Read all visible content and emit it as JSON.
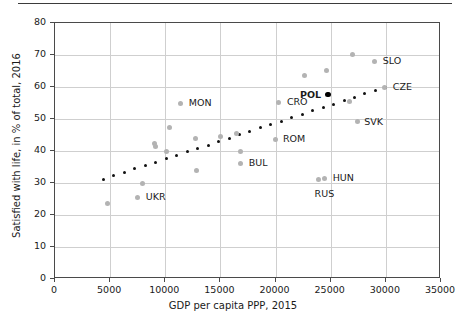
{
  "chart_data": {
    "type": "scatter",
    "title": "",
    "xlabel": "GDP per capita PPP, 2015",
    "ylabel": "Satisfied with life, in % of total, 2016",
    "xlim": [
      0,
      35000
    ],
    "ylim": [
      0,
      80
    ],
    "xticks": [
      0,
      5000,
      10000,
      15000,
      20000,
      25000,
      30000,
      35000
    ],
    "yticks": [
      0,
      10,
      20,
      30,
      40,
      50,
      60,
      70,
      80
    ],
    "xticklabels": [
      "0",
      "5000",
      "10000",
      "15000",
      "20000",
      "25000",
      "30000",
      "35000"
    ],
    "yticklabels": [
      "0",
      "10",
      "20",
      "30",
      "40",
      "50",
      "60",
      "70",
      "80"
    ],
    "grid": "both",
    "legend": "none",
    "marker_color": "#b3b3b3",
    "highlight_color": "#000000",
    "trendline_color": "#111111",
    "points": [
      {
        "x": 4800,
        "y": 23.5,
        "label": "",
        "highlight": false
      },
      {
        "x": 7500,
        "y": 25.5,
        "label": "UKR",
        "highlight": false,
        "label_dx": 9,
        "label_dy": -4
      },
      {
        "x": 7900,
        "y": 30.0,
        "label": "",
        "highlight": false
      },
      {
        "x": 9050,
        "y": 42.5,
        "label": "",
        "highlight": false
      },
      {
        "x": 9100,
        "y": 41.3,
        "label": "",
        "highlight": false
      },
      {
        "x": 10150,
        "y": 39.8,
        "label": "",
        "highlight": false
      },
      {
        "x": 10400,
        "y": 47.2,
        "label": "",
        "highlight": false
      },
      {
        "x": 11400,
        "y": 55.0,
        "label": "MON",
        "highlight": false,
        "label_dx": 9,
        "label_dy": -4
      },
      {
        "x": 12700,
        "y": 44.0,
        "label": "",
        "highlight": false
      },
      {
        "x": 12800,
        "y": 33.8,
        "label": "",
        "highlight": false
      },
      {
        "x": 15000,
        "y": 44.4,
        "label": "",
        "highlight": false
      },
      {
        "x": 16500,
        "y": 45.5,
        "label": "",
        "highlight": false
      },
      {
        "x": 16800,
        "y": 39.9,
        "label": "",
        "highlight": false
      },
      {
        "x": 16850,
        "y": 36.1,
        "label": "BUL",
        "highlight": false,
        "label_dx": 9,
        "label_dy": -4
      },
      {
        "x": 19950,
        "y": 43.6,
        "label": "ROM",
        "highlight": false,
        "label_dx": 9,
        "label_dy": -4
      },
      {
        "x": 20300,
        "y": 55.2,
        "label": "CRO",
        "highlight": false,
        "label_dx": 9,
        "label_dy": -4
      },
      {
        "x": 22600,
        "y": 63.5,
        "label": "",
        "highlight": false
      },
      {
        "x": 23900,
        "y": 31.0,
        "label": "RUS",
        "highlight": false,
        "label_dx": -3,
        "label_dy": 10
      },
      {
        "x": 24450,
        "y": 31.5,
        "label": "HUN",
        "highlight": false,
        "label_dx": 9,
        "label_dy": -4
      },
      {
        "x": 24600,
        "y": 65.2,
        "label": "",
        "highlight": false
      },
      {
        "x": 24750,
        "y": 57.6,
        "label": "POL",
        "highlight": true,
        "label_dx": -27,
        "label_dy": -4
      },
      {
        "x": 26700,
        "y": 55.4,
        "label": "",
        "highlight": false
      },
      {
        "x": 27000,
        "y": 70.1,
        "label": "",
        "highlight": false
      },
      {
        "x": 27400,
        "y": 49.1,
        "label": "SVK",
        "highlight": false,
        "label_dx": 8,
        "label_dy": 0
      },
      {
        "x": 29000,
        "y": 68.0,
        "label": "SLO",
        "highlight": false,
        "label_dx": 9,
        "label_dy": -4
      },
      {
        "x": 29900,
        "y": 60.0,
        "label": "CZE",
        "highlight": false,
        "label_dx": 9,
        "label_dy": -4,
        "on_trend": true
      }
    ],
    "trendline": {
      "style": "dotted",
      "x_start": 4400,
      "x_end": 30000,
      "y_start": 31.2,
      "y_end": 60.0,
      "n_dots": 28
    }
  },
  "figure": {
    "top_rule": true
  }
}
